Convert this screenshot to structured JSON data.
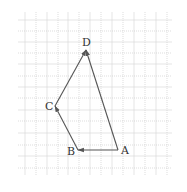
{
  "diagram": {
    "type": "vector-path-on-grid",
    "grid": {
      "x_lines": [
        25,
        36,
        47,
        58,
        68,
        79,
        90,
        101,
        112,
        123,
        134,
        145,
        156,
        167
      ],
      "y_lines": [
        20,
        31,
        42,
        53,
        64,
        76,
        87,
        98,
        110,
        121,
        133,
        145,
        156,
        168
      ],
      "x_min": 18,
      "x_max": 172,
      "y_min": 12,
      "y_max": 175,
      "color": "#c8c8c8"
    },
    "points": [
      {
        "name": "A",
        "x": 118,
        "y": 150,
        "label_x": 121,
        "label_y": 154
      },
      {
        "name": "B",
        "x": 78,
        "y": 150,
        "label_x": 67,
        "label_y": 155
      },
      {
        "name": "C",
        "x": 55,
        "y": 106,
        "label_x": 45,
        "label_y": 110
      },
      {
        "name": "D",
        "x": 86,
        "y": 50,
        "label_x": 82,
        "label_y": 46
      }
    ],
    "vectors": [
      {
        "from": "A",
        "to": "B"
      },
      {
        "from": "B",
        "to": "C"
      },
      {
        "from": "C",
        "to": "D"
      },
      {
        "from": "A",
        "to": "D"
      }
    ],
    "line_color": "#555555"
  }
}
